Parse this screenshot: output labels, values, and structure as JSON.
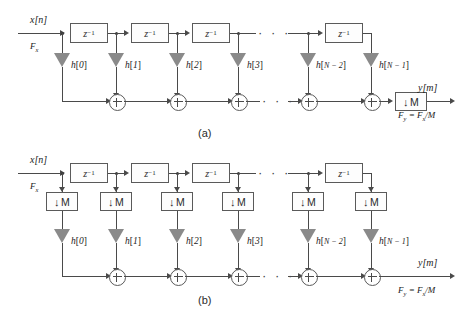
{
  "figure": {
    "type": "signal-flow-block-diagram",
    "topic": "FIR decimation filter structures",
    "line_color": "#4a4a4a",
    "ellipsis": "· · ·"
  },
  "symbols": {
    "delay_label": "z",
    "delay_exponent": "−1",
    "decimator_arrow": "↓",
    "decimator_factor": "M",
    "sum_symbol": "+"
  },
  "diagram_a": {
    "caption": "(a)",
    "input_signal": "x[n]",
    "input_rate": "F",
    "input_rate_sub": "x",
    "output_signal": "y[m]",
    "output_rate": "F",
    "output_rate_sub": "y",
    "output_rate_expr": " = F",
    "output_rate_expr_sub": "x",
    "output_rate_expr_tail": "/M",
    "delay_count": 4,
    "delays": [
      {
        "label": "z",
        "exp": "−1"
      },
      {
        "label": "z",
        "exp": "−1"
      },
      {
        "label": "z",
        "exp": "−1"
      },
      {
        "label": "z",
        "exp": "−1"
      }
    ],
    "coefficients": [
      {
        "name": "h",
        "index": "0"
      },
      {
        "name": "h",
        "index": "1"
      },
      {
        "name": "h",
        "index": "2"
      },
      {
        "name": "h",
        "index": "3"
      },
      {
        "name": "h",
        "index": "N − 2"
      },
      {
        "name": "h",
        "index": "N − 1"
      }
    ],
    "adder_count": 5,
    "output_decimator": {
      "arrow": "↓",
      "factor": "M"
    },
    "has_output_decimator": true
  },
  "diagram_b": {
    "caption": "(b)",
    "input_signal": "x[n]",
    "input_rate": "F",
    "input_rate_sub": "x",
    "output_signal": "y[m]",
    "output_rate": "F",
    "output_rate_sub": "y",
    "output_rate_expr": " = F",
    "output_rate_expr_sub": "x",
    "output_rate_expr_tail": "/M",
    "delay_count": 4,
    "delays": [
      {
        "label": "z",
        "exp": "−1"
      },
      {
        "label": "z",
        "exp": "−1"
      },
      {
        "label": "z",
        "exp": "−1"
      },
      {
        "label": "z",
        "exp": "−1"
      }
    ],
    "decimators": [
      {
        "arrow": "↓",
        "factor": "M"
      },
      {
        "arrow": "↓",
        "factor": "M"
      },
      {
        "arrow": "↓",
        "factor": "M"
      },
      {
        "arrow": "↓",
        "factor": "M"
      },
      {
        "arrow": "↓",
        "factor": "M"
      },
      {
        "arrow": "↓",
        "factor": "M"
      }
    ],
    "coefficients": [
      {
        "name": "h",
        "index": "0"
      },
      {
        "name": "h",
        "index": "1"
      },
      {
        "name": "h",
        "index": "2"
      },
      {
        "name": "h",
        "index": "3"
      },
      {
        "name": "h",
        "index": "N − 2"
      },
      {
        "name": "h",
        "index": "N − 1"
      }
    ],
    "adder_count": 5,
    "has_output_decimator": false
  }
}
